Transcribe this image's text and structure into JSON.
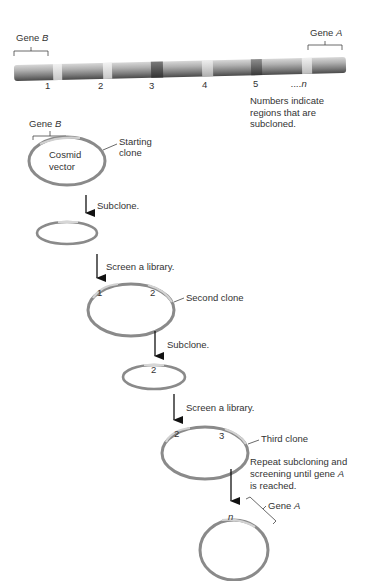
{
  "chromosome": {
    "gene_left": {
      "label": "Gene",
      "name": "B"
    },
    "gene_right": {
      "label": "Gene",
      "name": "A"
    },
    "regions": [
      "1",
      "2",
      "3",
      "4",
      "5"
    ],
    "region_last": "....n",
    "note_lines": [
      "Numbers indicate",
      "regions that are",
      "subcloned."
    ]
  },
  "steps": {
    "start_gene": {
      "label": "Gene",
      "name": "B"
    },
    "vector_label": [
      "Cosmid",
      "vector"
    ],
    "starting_clone": [
      "Starting",
      "clone"
    ],
    "subclone_1": "Subclone.",
    "screen_1": "Screen a library.",
    "second_clone": {
      "label": "Second clone",
      "marks": [
        "1",
        "2"
      ]
    },
    "subclone_2": "Subclone.",
    "subclone_2_mark": "2",
    "screen_2": "Screen a library.",
    "third_clone": {
      "label": "Third clone",
      "marks": [
        "2",
        "3"
      ]
    },
    "repeat_note": {
      "line1": "Repeat subcloning and",
      "line2_pre": "screening until gene ",
      "line2_gene": "A",
      "line3": "is reached."
    },
    "final_mark": "n",
    "final_gene": {
      "label": "Gene",
      "name": "A"
    }
  },
  "colors": {
    "ring": "#8a8a8a",
    "ring_light": "#c9c9c9",
    "chromosome": "#9a9a9a",
    "band_light": "#e2e2e2",
    "band_dark": "#5a5a5a",
    "arrow": "#111111"
  }
}
